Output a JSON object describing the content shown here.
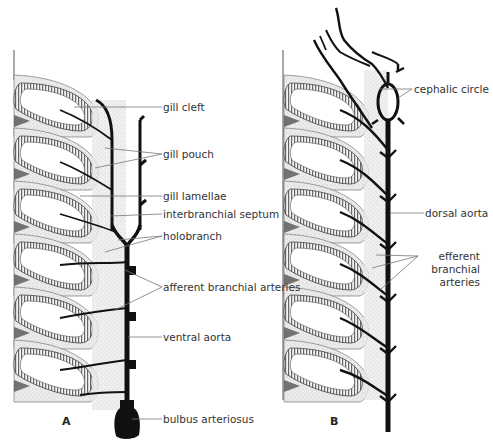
{
  "figure": {
    "colors": {
      "vessel": "#111111",
      "gill_fill": "#e4e4e4",
      "lamellae": "#555555",
      "leader": "#777777",
      "text": "#333333"
    }
  },
  "panels": [
    {
      "id": "A",
      "letter": "A",
      "labels": [
        {
          "key": "gill_cleft",
          "text": "gill cleft"
        },
        {
          "key": "gill_pouch",
          "text": "gill pouch"
        },
        {
          "key": "gill_lamellae",
          "text": "gill lamellae"
        },
        {
          "key": "interbranchial_septum",
          "text": "interbranchial septum"
        },
        {
          "key": "holobranch",
          "text": "holobranch"
        },
        {
          "key": "afferent_branchial_arteries",
          "text": "afferent branchial arteries"
        },
        {
          "key": "ventral_aorta",
          "text": "ventral aorta"
        },
        {
          "key": "bulbus_arteriosus",
          "text": "bulbus arteriosus"
        }
      ]
    },
    {
      "id": "B",
      "letter": "B",
      "labels": [
        {
          "key": "cephalic_circle",
          "text": "cephalic circle"
        },
        {
          "key": "dorsal_aorta",
          "text": "dorsal aorta"
        },
        {
          "key": "efferent_branchial_arteries",
          "text": "efferent branchial arteries"
        }
      ]
    }
  ]
}
